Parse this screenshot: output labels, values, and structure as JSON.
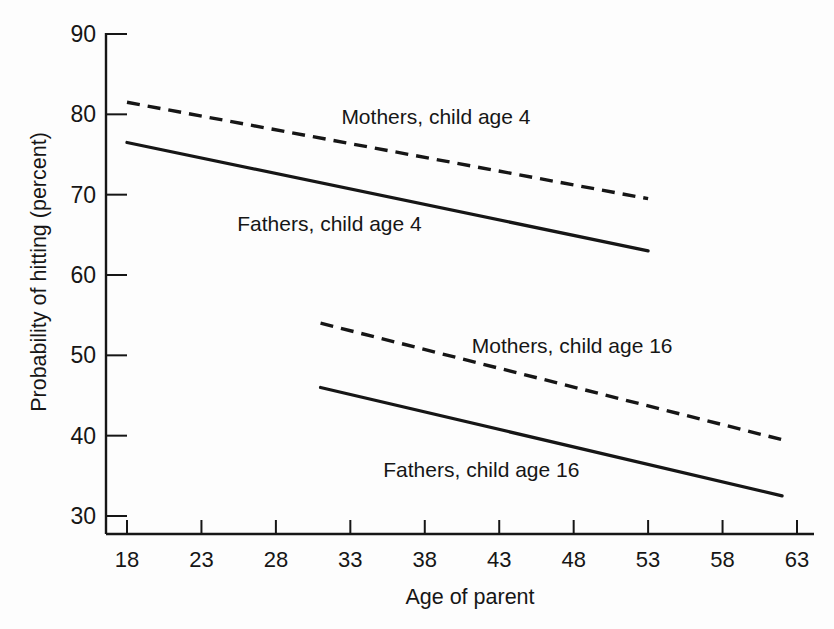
{
  "figure": {
    "background": "#fdfdfd",
    "ink_color": "#161616"
  },
  "chart_data": {
    "type": "line",
    "title": "",
    "xlabel": "Age of parent",
    "ylabel": "Probability of hitting (percent)",
    "xlim": [
      18,
      63
    ],
    "ylim": [
      30,
      90
    ],
    "xticks": [
      18,
      23,
      28,
      33,
      38,
      43,
      48,
      53,
      58,
      63
    ],
    "yticks": [
      30,
      40,
      50,
      60,
      70,
      80,
      90
    ],
    "grid": false,
    "legend_position": "inline-annotations",
    "series": [
      {
        "name": "Mothers, child age 4",
        "style": "dashed",
        "color": "#161616",
        "points": [
          [
            18,
            81.5
          ],
          [
            53,
            69.5
          ]
        ]
      },
      {
        "name": "Fathers, child age 4",
        "style": "solid",
        "color": "#161616",
        "points": [
          [
            18,
            76.5
          ],
          [
            53,
            63.0
          ]
        ]
      },
      {
        "name": "Mothers, child age 16",
        "style": "dashed",
        "color": "#161616",
        "points": [
          [
            31,
            54.0
          ],
          [
            62,
            39.5
          ]
        ]
      },
      {
        "name": "Fathers, child age 16",
        "style": "solid",
        "color": "#161616",
        "points": [
          [
            31,
            46.0
          ],
          [
            62,
            32.5
          ]
        ]
      }
    ],
    "annotations": [
      {
        "text": "Mothers, child age 4",
        "x": 38.75,
        "y": 78.8
      },
      {
        "text": "Fathers, child age 4",
        "x": 31.6,
        "y": 65.5
      },
      {
        "text": "Mothers, child age 16",
        "x": 47.9,
        "y": 50.3
      },
      {
        "text": "Fathers, child age 16",
        "x": 41.8,
        "y": 34.9
      }
    ]
  }
}
